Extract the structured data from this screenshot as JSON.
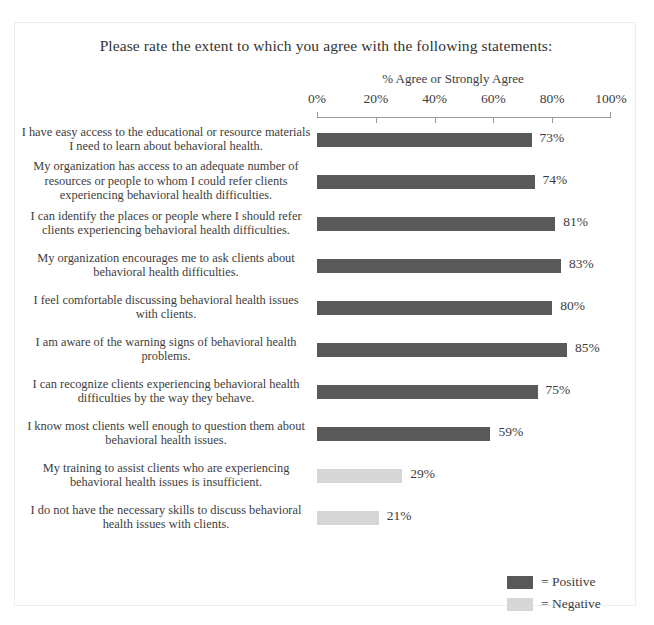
{
  "chart_data": {
    "type": "bar",
    "orientation": "horizontal",
    "title": "Please rate the extent to which you agree with the following statements:",
    "xlabel": "% Agree or Strongly Agree",
    "ylabel": "",
    "xlim": [
      0,
      100
    ],
    "xticks": [
      "0%",
      "20%",
      "40%",
      "60%",
      "80%",
      "100%"
    ],
    "xtick_values": [
      0,
      20,
      40,
      60,
      80,
      100
    ],
    "grid": false,
    "legend_position": "bottom-right",
    "categories": [
      "I have easy access to the educational or resource materials I need to learn about behavioral health.",
      "My organization has access to an adequate number of resources or people to whom I could refer clients experiencing behavioral health difficulties.",
      "I can identify the places or people where I should refer clients experiencing behavioral health difficulties.",
      "My organization encourages me to ask clients about behavioral health difficulties.",
      "I feel comfortable discussing behavioral health issues with clients.",
      "I am aware of the warning signs of behavioral health problems.",
      "I can recognize clients experiencing behavioral health difficulties by the way they behave.",
      "I know most clients well enough to question them about behavioral health issues.",
      "My training to assist clients who are experiencing behavioral health issues is insufficient.",
      "I do not have the necessary skills to discuss behavioral health issues with clients."
    ],
    "values": [
      73,
      74,
      81,
      83,
      80,
      85,
      75,
      59,
      29,
      21
    ],
    "value_labels": [
      "73%",
      "74%",
      "81%",
      "83%",
      "80%",
      "85%",
      "75%",
      "59%",
      "29%",
      "21%"
    ],
    "bar_types": [
      "positive",
      "positive",
      "positive",
      "positive",
      "positive",
      "positive",
      "positive",
      "positive",
      "negative",
      "negative"
    ],
    "legend": [
      {
        "key": "positive",
        "label": "= Positive",
        "color": "#595959"
      },
      {
        "key": "negative",
        "label": "= Negative",
        "color": "#d6d6d6"
      }
    ],
    "colors": {
      "positive": "#595959",
      "negative": "#d6d6d6",
      "axis": "#9a9a9a",
      "text": "#3c3c3c",
      "background": "#ffffff"
    }
  }
}
